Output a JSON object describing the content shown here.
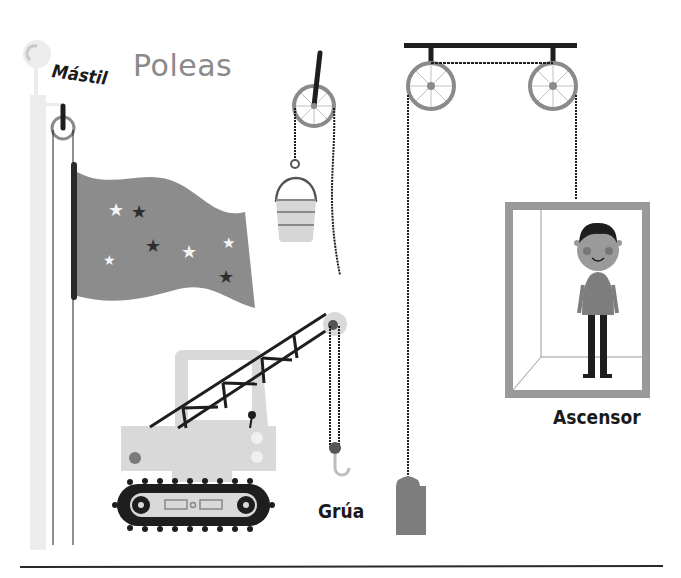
{
  "title": "Poleas",
  "labels": {
    "mast": "Mástil",
    "crane": "Grúa",
    "elevator": "Ascensor"
  },
  "scenes": [
    {
      "name": "flagpole",
      "description": "Flag raised on a mast with a single pulley"
    },
    {
      "name": "bucket-pulley",
      "description": "Bucket hanging from a single fixed pulley with rope"
    },
    {
      "name": "crane",
      "description": "Tracked crane with lattice boom, pulley block and hook"
    },
    {
      "name": "elevator",
      "description": "Elevator cabin with boy, hung from two pulleys with counterweight"
    }
  ],
  "colors": {
    "background": "#ffffff",
    "title": "#8a8a8a",
    "dark": "#1e1e1e",
    "mid_gray": "#7d7d7d",
    "light_gray": "#d4d4d4",
    "pale": "#ececec"
  }
}
